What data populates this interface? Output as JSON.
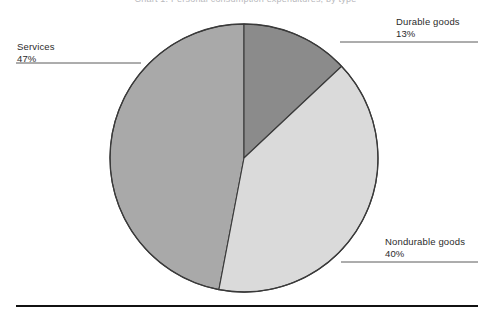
{
  "figure": {
    "cropped_title": "Chart 1. Personal consumption expenditures, by type",
    "background_color": "#ffffff",
    "baseline_rule_color": "#111111"
  },
  "chart_data": {
    "type": "pie",
    "title": "",
    "xlabel": "",
    "ylabel": "",
    "grid": false,
    "legend_position": "callout-labels",
    "start_angle_deg": 0,
    "direction": "clockwise",
    "units": "percent",
    "categories": [
      "Durable goods",
      "Nondurable goods",
      "Services"
    ],
    "values": [
      13,
      40,
      47
    ],
    "slices": [
      {
        "label": "Durable goods",
        "value": 13,
        "value_text": "13%",
        "color": "#8b8b8b",
        "start_deg": 0,
        "end_deg": 46.8
      },
      {
        "label": "Nondurable goods",
        "value": 40,
        "value_text": "40%",
        "color": "#dadada",
        "start_deg": 46.8,
        "end_deg": 190.8
      },
      {
        "label": "Services",
        "value": 47,
        "value_text": "47%",
        "color": "#a9a9a9",
        "start_deg": 190.8,
        "end_deg": 360
      }
    ]
  },
  "callouts": {
    "services": {
      "category": "Services",
      "percent": "47%"
    },
    "durable": {
      "category": "Durable goods",
      "percent": "13%"
    },
    "nondurable": {
      "category": "Nondurable goods",
      "percent": "40%"
    }
  }
}
